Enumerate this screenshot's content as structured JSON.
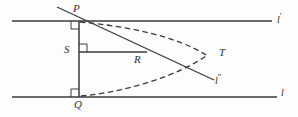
{
  "figure": {
    "background_color": "#fdfdfd",
    "stroke_color": "#3a3a3a",
    "label_color": "#2f2f2f",
    "width": 298,
    "height": 117
  },
  "labels": {
    "p": {
      "text": "P",
      "x": 73,
      "y": 3
    },
    "q": {
      "text": "Q",
      "x": 74,
      "y": 99
    },
    "s": {
      "text": "S",
      "x": 64,
      "y": 44
    },
    "r": {
      "text": "R",
      "x": 134,
      "y": 54
    },
    "t": {
      "text": "T",
      "x": 219,
      "y": 47
    },
    "l_top": {
      "base": "l",
      "prime": "′",
      "x": 277,
      "y": 12
    },
    "l_mid": {
      "base": "l",
      "prime": "″",
      "x": 215,
      "y": 73
    },
    "l_bottom": {
      "base": "l",
      "prime": "",
      "x": 281,
      "y": 85
    }
  },
  "geometry": {
    "line_l_prime": {
      "name": "upper parallel line",
      "x1": 12,
      "y1": 21,
      "x2": 272,
      "y2": 21
    },
    "line_l": {
      "name": "lower parallel line",
      "x1": 12,
      "y1": 97,
      "x2": 277,
      "y2": 97
    },
    "line_l_double_prime": {
      "name": "transversal through P",
      "x1": 57,
      "y1": 7,
      "x2": 214,
      "y2": 80
    },
    "segment_pq": {
      "name": "vertical segment P to Q",
      "x1": 79,
      "y1": 21,
      "x2": 79,
      "y2": 97
    },
    "segment_sr": {
      "name": "horizontal segment S to R",
      "x1": 79,
      "y1": 52,
      "x2": 147,
      "y2": 52
    },
    "curve_upper": {
      "name": "upper dashed branch from P to T",
      "path": "M 80 22 C 126 26, 176 36, 206 55"
    },
    "curve_lower": {
      "name": "lower dashed branch from Q to T",
      "path": "M 81 96 C 126 92, 177 76, 206 56"
    },
    "right_angle_p": {
      "name": "right angle mark at P",
      "x": 71,
      "y": 21,
      "size": 8
    },
    "right_angle_s": {
      "name": "right angle mark at S",
      "x": 79,
      "y": 44,
      "size": 8
    },
    "right_angle_q": {
      "name": "right angle mark at Q",
      "x": 71,
      "y": 89,
      "size": 8
    }
  },
  "points": {
    "P": {
      "x": 79,
      "y": 21
    },
    "Q": {
      "x": 79,
      "y": 97
    },
    "S": {
      "x": 79,
      "y": 52
    },
    "R": {
      "x": 147,
      "y": 52
    },
    "T": {
      "x": 208,
      "y": 55
    }
  }
}
